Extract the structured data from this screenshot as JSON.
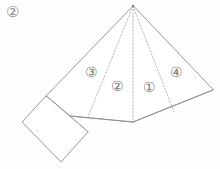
{
  "figure": {
    "tag": "②",
    "description_type": "geometric-net-diagram",
    "stroke_color": "#8e8e8e",
    "dash_color": "#a9a9a9",
    "background_color": "#fefefe",
    "canvas": {
      "width": 220,
      "height": 169
    }
  },
  "sector_labels": [
    {
      "id": "sector-3",
      "text": "③",
      "x": 91,
      "y": 73
    },
    {
      "id": "sector-2",
      "text": "②",
      "x": 117,
      "y": 87
    },
    {
      "id": "sector-1",
      "text": "①",
      "x": 149,
      "y": 88
    },
    {
      "id": "sector-4",
      "text": "④",
      "x": 176,
      "y": 73
    }
  ],
  "geometry": {
    "apex": {
      "x": 133,
      "y": 6
    },
    "solid_outline": "M133,6 L46,96 L70,116 L133,122 L213,90 Z",
    "flap_outline": "M46,96 L22,122 L61,162 L88,132 Z",
    "flap_dashed_edge": "M46,96 L88,132",
    "fold_lines": [
      {
        "id": "fold-left",
        "d": "M133,6 L88,117",
        "style": "dashed"
      },
      {
        "id": "fold-center",
        "d": "M133,6 L133,122",
        "style": "dashed"
      },
      {
        "id": "fold-right",
        "d": "M133,6 L174,112",
        "style": "dashed"
      }
    ],
    "base_segments": [
      {
        "id": "base-left",
        "d": "M70,116 L133,122"
      },
      {
        "id": "base-right",
        "d": "M133,122 L213,90"
      }
    ]
  }
}
